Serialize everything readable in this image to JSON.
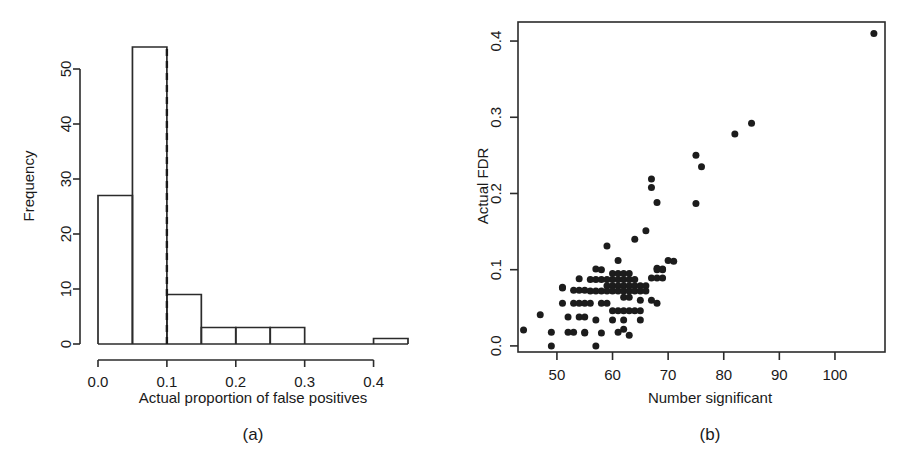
{
  "figure": {
    "panels": [
      {
        "id": "a",
        "caption": "(a)",
        "chart_index": 0
      },
      {
        "id": "b",
        "caption": "(b)",
        "chart_index": 1
      }
    ]
  },
  "chart_data": [
    {
      "type": "bar",
      "title": "",
      "xlabel": "Actual proportion of false positives",
      "ylabel": "Frequency",
      "xlim": [
        0.0,
        0.45
      ],
      "ylim": [
        0,
        56
      ],
      "xticks": [
        0.0,
        0.1,
        0.2,
        0.3,
        0.4
      ],
      "xticklabels": [
        "0.0",
        "0.1",
        "0.2",
        "0.3",
        "0.4"
      ],
      "yticks": [
        0,
        10,
        20,
        30,
        40,
        50
      ],
      "yticklabels": [
        "0",
        "10",
        "20",
        "30",
        "40",
        "50"
      ],
      "grid": false,
      "bin_width": 0.05,
      "bin_edges": [
        0.0,
        0.05,
        0.1,
        0.15,
        0.2,
        0.25,
        0.3,
        0.35,
        0.4,
        0.45
      ],
      "categories": [
        "0.00-0.05",
        "0.05-0.10",
        "0.10-0.15",
        "0.15-0.20",
        "0.20-0.25",
        "0.25-0.30",
        "0.30-0.35",
        "0.35-0.40",
        "0.40-0.45"
      ],
      "values": [
        27,
        54,
        9,
        3,
        3,
        3,
        0,
        0,
        1
      ],
      "annotations": [
        {
          "name": "nominal-fdr-threshold",
          "type": "vline",
          "x": 0.1,
          "style": "dashed",
          "y_from": 0,
          "y_to": 54
        }
      ]
    },
    {
      "type": "scatter",
      "title": "",
      "xlabel": "Number significant",
      "ylabel": "Actual FDR",
      "xlim": [
        43,
        109
      ],
      "ylim": [
        -0.008,
        0.425
      ],
      "xticks": [
        50,
        60,
        70,
        80,
        90,
        100
      ],
      "xticklabels": [
        "50",
        "60",
        "70",
        "80",
        "90",
        "100"
      ],
      "yticks": [
        0.0,
        0.1,
        0.2,
        0.3,
        0.4
      ],
      "yticklabels": [
        "0.0",
        "0.1",
        "0.2",
        "0.3",
        "0.4"
      ],
      "grid": false,
      "marker": "filled-circle",
      "point_color": "#1c1c1c",
      "x": [
        44,
        47,
        49,
        49,
        51,
        51,
        51,
        52,
        52,
        53,
        53,
        54,
        54,
        54,
        54,
        55,
        55,
        55,
        55,
        56,
        56,
        56,
        57,
        57,
        57,
        57,
        58,
        58,
        58,
        58,
        58,
        59,
        59,
        59,
        59,
        59,
        60,
        60,
        60,
        60,
        60,
        61,
        61,
        61,
        61,
        61,
        61,
        62,
        62,
        62,
        62,
        62,
        62,
        62,
        63,
        63,
        63,
        63,
        63,
        63,
        63,
        64,
        64,
        64,
        64,
        64,
        65,
        65,
        65,
        65,
        66,
        66,
        66,
        67,
        67,
        67,
        67,
        68,
        68,
        68,
        68,
        68,
        69,
        69,
        69,
        70,
        71,
        75,
        75,
        76,
        82,
        85,
        107,
        57,
        60,
        62,
        65,
        55,
        53,
        61
      ],
      "y": [
        0.021,
        0.041,
        0.018,
        0.0,
        0.077,
        0.076,
        0.056,
        0.038,
        0.018,
        0.073,
        0.056,
        0.088,
        0.073,
        0.056,
        0.038,
        0.073,
        0.056,
        0.038,
        0.017,
        0.087,
        0.072,
        0.056,
        0.101,
        0.087,
        0.072,
        0.034,
        0.1,
        0.087,
        0.072,
        0.056,
        0.017,
        0.131,
        0.087,
        0.079,
        0.072,
        0.056,
        0.095,
        0.087,
        0.079,
        0.072,
        0.046,
        0.112,
        0.095,
        0.087,
        0.079,
        0.072,
        0.046,
        0.095,
        0.087,
        0.079,
        0.072,
        0.064,
        0.046,
        0.022,
        0.095,
        0.087,
        0.079,
        0.072,
        0.064,
        0.046,
        0.014,
        0.14,
        0.087,
        0.079,
        0.072,
        0.046,
        0.079,
        0.072,
        0.06,
        0.046,
        0.151,
        0.079,
        0.072,
        0.208,
        0.219,
        0.089,
        0.06,
        0.188,
        0.102,
        0.1,
        0.089,
        0.056,
        0.101,
        0.1,
        0.089,
        0.112,
        0.111,
        0.25,
        0.187,
        0.235,
        0.278,
        0.292,
        0.41,
        0.0,
        0.034,
        0.034,
        0.034,
        0.018,
        0.018,
        0.018
      ]
    }
  ]
}
